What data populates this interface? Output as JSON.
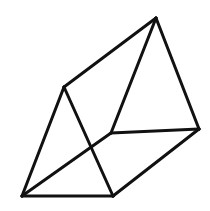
{
  "figure": {
    "shape_name": "triangular-prism",
    "background_color": "#ffffff",
    "stroke_color": "#111111",
    "stroke_width": 3,
    "canvas": {
      "width": 210,
      "height": 211
    },
    "vertices": [
      {
        "id": "apex-top",
        "name": "top-apex-vertex",
        "x": 156,
        "y": 18
      },
      {
        "id": "left-upper",
        "name": "left-upper-vertex",
        "x": 64,
        "y": 87
      },
      {
        "id": "center-junction",
        "name": "center-junction-vertex",
        "x": 111,
        "y": 133
      },
      {
        "id": "right",
        "name": "right-vertex",
        "x": 199,
        "y": 129
      },
      {
        "id": "bottom-left",
        "name": "bottom-left-vertex",
        "x": 22,
        "y": 196
      },
      {
        "id": "bottom-mid",
        "name": "bottom-middle-vertex",
        "x": 113,
        "y": 196
      }
    ],
    "edges": [
      {
        "name": "edge-left-upper-to-apex",
        "from": "left-upper",
        "to": "apex-top"
      },
      {
        "name": "edge-apex-to-right",
        "from": "apex-top",
        "to": "right"
      },
      {
        "name": "edge-apex-to-center",
        "from": "apex-top",
        "to": "center-junction"
      },
      {
        "name": "edge-center-to-right",
        "from": "center-junction",
        "to": "right"
      },
      {
        "name": "edge-right-to-bottom-mid",
        "from": "right",
        "to": "bottom-mid"
      },
      {
        "name": "edge-left-upper-to-bottom-left",
        "from": "left-upper",
        "to": "bottom-left"
      },
      {
        "name": "edge-left-upper-to-bottom-mid",
        "from": "left-upper",
        "to": "bottom-mid"
      },
      {
        "name": "edge-center-to-bottom-left",
        "from": "center-junction",
        "to": "bottom-left"
      },
      {
        "name": "edge-bottom-left-to-bottom-mid",
        "from": "bottom-left",
        "to": "bottom-mid"
      }
    ]
  }
}
